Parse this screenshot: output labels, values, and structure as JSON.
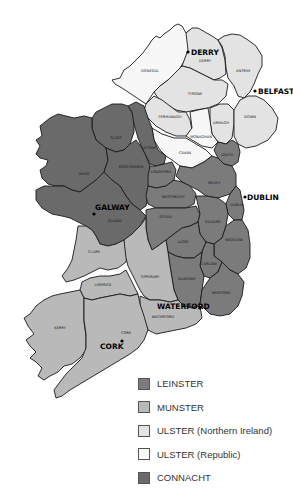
{
  "map": {
    "title": "Provinces and Counties of Ireland",
    "colors": {
      "leinster": "#7b7b7b",
      "munster": "#b9b9b9",
      "ulster_ni": "#e3e3e3",
      "ulster_rep": "#f7f7f7",
      "connacht": "#6a6a6a"
    },
    "counties": {
      "donegal": "DONEGAL",
      "derry": "DERRY",
      "antrim": "ANTRIM",
      "tyrone": "TYRONE",
      "fermanagh": "FERMANAGH",
      "armagh": "ARMAGH",
      "down": "DOWN",
      "monaghan": "MONAGHAN",
      "cavan": "CAVAN",
      "sligo": "SLIGO",
      "leitrim": "LEITRIM",
      "louth": "LOUTH",
      "mayo": "MAYO",
      "roscommon": "ROSCOMMON",
      "longford": "LONGFORD",
      "meath": "MEATH",
      "westmeath": "WESTMEATH",
      "dublin": "DUBLIN",
      "galway": "GALWAY",
      "offaly": "OFFALY",
      "kildare": "KILDARE",
      "laois": "LAOIS",
      "wicklow": "WICKLOW",
      "clare": "CLARE",
      "tipperary": "TIPPERARY",
      "carlow": "CARLOW",
      "kilkenny": "KILKENNY",
      "limerick": "LIMERICK",
      "wexford": "WEXFORD",
      "waterford": "WATERFORD",
      "kerry": "KERRY",
      "cork": "CORK"
    },
    "cities": {
      "derry": "DERRY",
      "belfast": "BELFAST",
      "dublin": "DUBLIN",
      "galway": "GALWAY",
      "waterford": "WATERFORD",
      "cork": "CORK"
    }
  },
  "legend": {
    "items": [
      {
        "label": "LEINSTER",
        "color": "#7b7b7b"
      },
      {
        "label": "MUNSTER",
        "color": "#b9b9b9"
      },
      {
        "label": "ULSTER (Northern Ireland)",
        "color": "#e3e3e3"
      },
      {
        "label": "ULSTER (Republic)",
        "color": "#f7f7f7"
      },
      {
        "label": "CONNACHT",
        "color": "#6a6a6a"
      }
    ]
  }
}
